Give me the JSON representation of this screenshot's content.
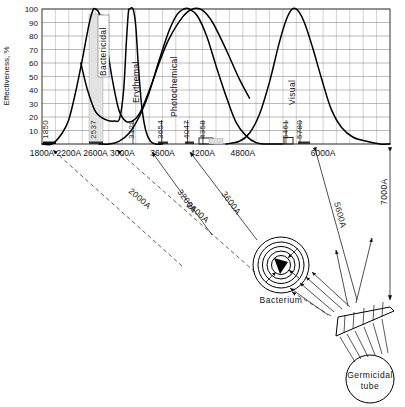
{
  "chart_data": {
    "type": "line",
    "title": "",
    "xlabel": "",
    "ylabel": "Effectiveness, %",
    "xlim": [
      1800,
      7000
    ],
    "ylim": [
      0,
      100
    ],
    "grid": true,
    "x_unit": "A",
    "x_ticks": [
      "1800A",
      "2200A",
      "2600A",
      "3000A",
      "3600A",
      "4200A",
      "4800A",
      "6000A"
    ],
    "x_tick_values": [
      1800,
      2200,
      2600,
      3000,
      3600,
      4200,
      4800,
      6000
    ],
    "y_ticks": [
      "10",
      "20",
      "30",
      "40",
      "50",
      "60",
      "70",
      "80",
      "90",
      "100"
    ],
    "y_tick_values": [
      10,
      20,
      30,
      40,
      50,
      60,
      70,
      80,
      90,
      100
    ],
    "series": [
      {
        "name": "Bactericidal",
        "label": "Bactericidal",
        "points": [
          [
            1800,
            0
          ],
          [
            1950,
            0
          ],
          [
            2100,
            8
          ],
          [
            2200,
            18
          ],
          [
            2300,
            38
          ],
          [
            2400,
            62
          ],
          [
            2500,
            88
          ],
          [
            2560,
            99
          ],
          [
            2600,
            100
          ],
          [
            2660,
            96
          ],
          [
            2750,
            78
          ],
          [
            2850,
            48
          ],
          [
            2950,
            25
          ],
          [
            3050,
            17
          ],
          [
            3150,
            17
          ],
          [
            3250,
            22
          ],
          [
            3350,
            33
          ],
          [
            3450,
            46
          ],
          [
            3550,
            60
          ],
          [
            3700,
            78
          ],
          [
            3900,
            94
          ],
          [
            4050,
            100
          ],
          [
            4200,
            99
          ],
          [
            4350,
            90
          ],
          [
            4550,
            70
          ],
          [
            4750,
            48
          ],
          [
            4900,
            34
          ]
        ]
      },
      {
        "name": "Erythemal",
        "label": "Erythemal",
        "points": [
          [
            2380,
            60
          ],
          [
            2480,
            40
          ],
          [
            2600,
            24
          ],
          [
            2750,
            18
          ],
          [
            2880,
            17
          ],
          [
            2960,
            19
          ],
          [
            3020,
            40
          ],
          [
            3060,
            75
          ],
          [
            3090,
            97
          ],
          [
            3110,
            100
          ],
          [
            3160,
            100
          ],
          [
            3200,
            88
          ],
          [
            3240,
            58
          ],
          [
            3290,
            28
          ],
          [
            3350,
            10
          ],
          [
            3420,
            2
          ],
          [
            3500,
            0
          ],
          [
            3600,
            0
          ]
        ]
      },
      {
        "name": "Photochemical",
        "label": "Photochemical",
        "points": [
          [
            2650,
            0
          ],
          [
            2800,
            0
          ],
          [
            2950,
            2
          ],
          [
            3100,
            8
          ],
          [
            3250,
            20
          ],
          [
            3400,
            38
          ],
          [
            3550,
            62
          ],
          [
            3700,
            84
          ],
          [
            3820,
            96
          ],
          [
            3920,
            100
          ],
          [
            4000,
            100
          ],
          [
            4120,
            95
          ],
          [
            4260,
            80
          ],
          [
            4400,
            58
          ],
          [
            4560,
            34
          ],
          [
            4700,
            16
          ],
          [
            4850,
            6
          ],
          [
            5000,
            1
          ],
          [
            5150,
            0
          ],
          [
            5400,
            0
          ]
        ]
      },
      {
        "name": "Visual",
        "label": "Visual",
        "points": [
          [
            4550,
            0
          ],
          [
            4750,
            2
          ],
          [
            4900,
            8
          ],
          [
            5050,
            22
          ],
          [
            5200,
            46
          ],
          [
            5340,
            74
          ],
          [
            5450,
            92
          ],
          [
            5540,
            100
          ],
          [
            5620,
            99
          ],
          [
            5720,
            90
          ],
          [
            5840,
            72
          ],
          [
            5980,
            48
          ],
          [
            6120,
            26
          ],
          [
            6280,
            12
          ],
          [
            6450,
            5
          ],
          [
            6650,
            2
          ],
          [
            6850,
            0
          ],
          [
            7000,
            0
          ]
        ]
      }
    ],
    "spectral_lines": [
      {
        "label": "1850",
        "value": 1850,
        "marker": "bar"
      },
      {
        "label": "2537",
        "value": 2537,
        "marker": "band"
      },
      {
        "label": "3129",
        "value": 3129,
        "marker": "tick"
      },
      {
        "label": "3654",
        "value": 3654,
        "marker": "bar"
      },
      {
        "label": "4047",
        "value": 4047,
        "marker": "bar"
      },
      {
        "label": "4358",
        "value": 4358,
        "marker": "box"
      },
      {
        "label": "5461",
        "value": 5461,
        "marker": "box"
      },
      {
        "label": "5780",
        "value": 5780,
        "marker": "bar"
      }
    ]
  },
  "axis": {
    "y_title": "Effectiveness, %"
  },
  "rays": [
    {
      "label": "2000A",
      "style": "dashed"
    },
    {
      "label": "2600A",
      "style": "dashed"
    },
    {
      "label": "3200A",
      "style": "solid"
    },
    {
      "label": "3600A",
      "style": "solid"
    },
    {
      "label": "5600A",
      "style": "solid"
    },
    {
      "label": "7000A",
      "style": "solid"
    }
  ],
  "diagram": {
    "bacterium_label": "Bacterium",
    "source_label_line1": "Germicidal",
    "source_label_line2": "tube"
  }
}
